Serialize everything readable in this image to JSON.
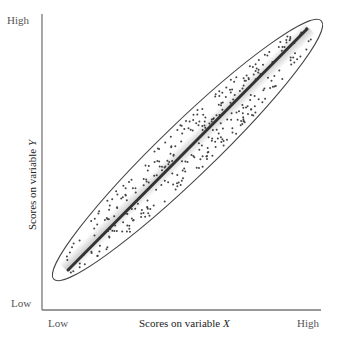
{
  "chart_data": {
    "type": "scatter",
    "title": "",
    "xlabel": "Scores on variable X",
    "ylabel": "Scores on variable Y",
    "x_tick_labels": [
      "Low",
      "High"
    ],
    "y_tick_labels": [
      "Low",
      "High"
    ],
    "xlim": [
      0,
      1
    ],
    "ylim": [
      0,
      1
    ],
    "grid": false,
    "legend": null,
    "annotations": [
      "ellipse enclosing points",
      "regression line (positive correlation)"
    ],
    "regression_line": {
      "x": [
        0.09,
        0.95
      ],
      "y": [
        0.14,
        0.96
      ]
    }
  },
  "axes": {
    "x_low": "Low",
    "x_high": "High",
    "y_low": "Low",
    "y_high": "High",
    "x_title_prefix": "Scores on variable ",
    "x_title_var": "X",
    "y_title_prefix": "Scores on variable ",
    "y_title_var": "Y"
  },
  "colors": {
    "axis": "#777777",
    "points": "#444444",
    "line": "#333333",
    "ellipse": "#444444"
  }
}
